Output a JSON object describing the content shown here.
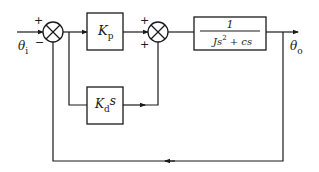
{
  "diagram": {
    "type": "block-diagram",
    "input": {
      "symbol": "θ",
      "subscript": "i"
    },
    "output": {
      "symbol": "θ",
      "subscript": "o"
    },
    "junction1": {
      "plus_sign": "+",
      "minus_sign": "−"
    },
    "junction2": {
      "top_sign": "+",
      "bottom_sign": "+"
    },
    "blocks": {
      "proportional": {
        "symbol": "K",
        "subscript": "p"
      },
      "derivative": {
        "symbol": "K",
        "subscript": "d",
        "suffix": "s"
      },
      "plant": {
        "numerator": "1",
        "den_J": "Js",
        "den_exp": "2",
        "den_rest": " + cs"
      }
    },
    "colors": {
      "line": "#1a1a1a",
      "background": "#ffffff"
    }
  }
}
